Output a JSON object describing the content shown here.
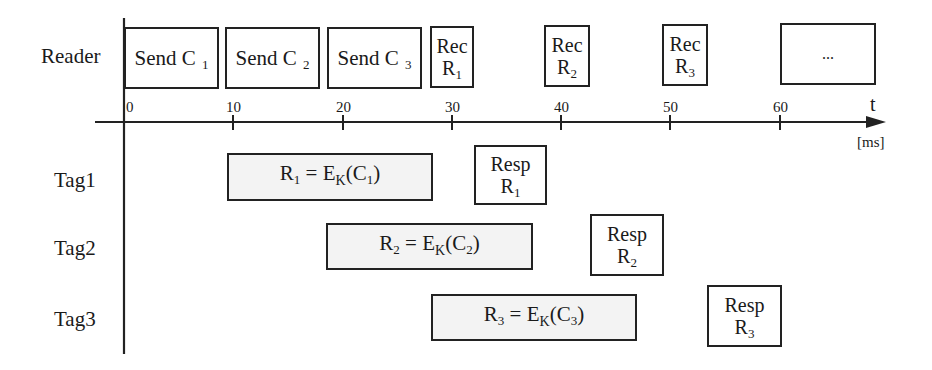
{
  "diagram": {
    "type": "timing-diagram",
    "time_axis": {
      "label": "t",
      "unit": "[ms]",
      "ticks": [
        "0",
        "10",
        "20",
        "30",
        "40",
        "50",
        "60"
      ]
    },
    "rows": [
      {
        "label": "Reader"
      },
      {
        "label": "Tag1"
      },
      {
        "label": "Tag2"
      },
      {
        "label": "Tag3"
      }
    ],
    "reader_blocks": [
      {
        "text": "Send C",
        "sub": "1"
      },
      {
        "text": "Send C",
        "sub": "2"
      },
      {
        "text": "Send C",
        "sub": "3"
      },
      {
        "line1": "Rec",
        "line2": "R",
        "sub": "1"
      },
      {
        "line1": "Rec",
        "line2": "R",
        "sub": "2"
      },
      {
        "line1": "Rec",
        "line2": "R",
        "sub": "3"
      },
      {
        "text": "..."
      }
    ],
    "tag_blocks": [
      {
        "compute": {
          "lhs": "R",
          "lhs_sub": "1",
          "eq": "=",
          "fn": "E",
          "fn_sub": "K",
          "arg": "C",
          "arg_sub": "1"
        },
        "resp": {
          "line1": "Resp",
          "line2": "R",
          "sub": "1"
        }
      },
      {
        "compute": {
          "lhs": "R",
          "lhs_sub": "2",
          "eq": "=",
          "fn": "E",
          "fn_sub": "K",
          "arg": "C",
          "arg_sub": "2"
        },
        "resp": {
          "line1": "Resp",
          "line2": "R",
          "sub": "2"
        }
      },
      {
        "compute": {
          "lhs": "R",
          "lhs_sub": "3",
          "eq": "=",
          "fn": "E",
          "fn_sub": "K",
          "arg": "C",
          "arg_sub": "3"
        },
        "resp": {
          "line1": "Resp",
          "line2": "R",
          "sub": "3"
        }
      }
    ],
    "colors": {
      "line": "#222222",
      "shaded_fill": "#f3f3f3",
      "background": "#ffffff"
    }
  }
}
